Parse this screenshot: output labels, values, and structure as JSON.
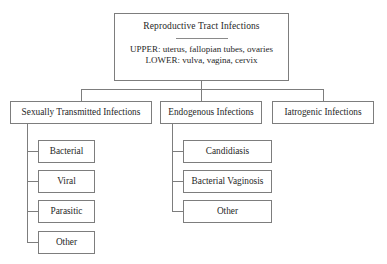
{
  "diagram": {
    "type": "tree-hierarchy",
    "colors": {
      "background": "#ffffff",
      "border": "#7d7d7d",
      "text": "#1f1f1f",
      "connector": "#7d7d7d"
    },
    "root": {
      "title": "Reproductive Tract Infections",
      "detail_upper": "UPPER: uterus, fallopian tubes, ovaries",
      "detail_lower": "LOWER: vulva, vagina, cervix"
    },
    "level2": [
      {
        "label": "Sexually Transmitted Infections"
      },
      {
        "label": "Endogenous Infections"
      },
      {
        "label": "Iatrogenic Infections"
      }
    ],
    "sti_children": [
      {
        "label": "Bacterial"
      },
      {
        "label": "Viral"
      },
      {
        "label": "Parasitic"
      },
      {
        "label": "Other"
      }
    ],
    "endogenous_children": [
      {
        "label": "Candidiasis"
      },
      {
        "label": "Bacterial Vaginosis"
      },
      {
        "label": "Other"
      }
    ],
    "iatrogenic_children": []
  }
}
